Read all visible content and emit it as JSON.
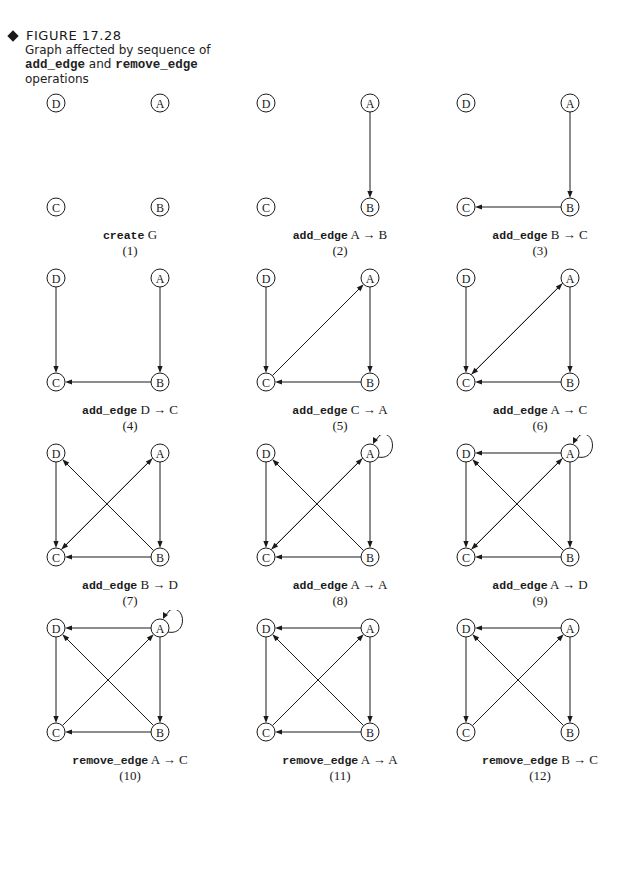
{
  "figure": {
    "number": "FIGURE 17.28",
    "caption_prefix": "Graph affected by sequence of",
    "caption_code_1": "add_edge",
    "caption_and": "and",
    "caption_code_2": "remove_edge",
    "caption_suffix": "operations"
  },
  "nodes": [
    "A",
    "B",
    "C",
    "D"
  ],
  "arrow": "→",
  "panels": [
    {
      "op": "create",
      "args": "G",
      "num": "(1)",
      "edges": [],
      "self_loop_A": false
    },
    {
      "op": "add_edge",
      "args": "A → B",
      "num": "(2)",
      "edges": [
        [
          "A",
          "B"
        ]
      ],
      "self_loop_A": false
    },
    {
      "op": "add_edge",
      "args": "B → C",
      "num": "(3)",
      "edges": [
        [
          "A",
          "B"
        ],
        [
          "B",
          "C"
        ]
      ],
      "self_loop_A": false
    },
    {
      "op": "add_edge",
      "args": "D → C",
      "num": "(4)",
      "edges": [
        [
          "A",
          "B"
        ],
        [
          "B",
          "C"
        ],
        [
          "D",
          "C"
        ]
      ],
      "self_loop_A": false
    },
    {
      "op": "add_edge",
      "args": "C → A",
      "num": "(5)",
      "edges": [
        [
          "A",
          "B"
        ],
        [
          "B",
          "C"
        ],
        [
          "D",
          "C"
        ],
        [
          "C",
          "A"
        ]
      ],
      "self_loop_A": false
    },
    {
      "op": "add_edge",
      "args": "A → C",
      "num": "(6)",
      "edges": [
        [
          "A",
          "B"
        ],
        [
          "B",
          "C"
        ],
        [
          "D",
          "C"
        ],
        [
          "C",
          "A"
        ],
        [
          "A",
          "C"
        ]
      ],
      "self_loop_A": false
    },
    {
      "op": "add_edge",
      "args": "B → D",
      "num": "(7)",
      "edges": [
        [
          "A",
          "B"
        ],
        [
          "B",
          "C"
        ],
        [
          "D",
          "C"
        ],
        [
          "C",
          "A"
        ],
        [
          "A",
          "C"
        ],
        [
          "B",
          "D"
        ]
      ],
      "self_loop_A": false
    },
    {
      "op": "add_edge",
      "args": "A → A",
      "num": "(8)",
      "edges": [
        [
          "A",
          "B"
        ],
        [
          "B",
          "C"
        ],
        [
          "D",
          "C"
        ],
        [
          "C",
          "A"
        ],
        [
          "A",
          "C"
        ],
        [
          "B",
          "D"
        ]
      ],
      "self_loop_A": true
    },
    {
      "op": "add_edge",
      "args": "A → D",
      "num": "(9)",
      "edges": [
        [
          "A",
          "B"
        ],
        [
          "B",
          "C"
        ],
        [
          "D",
          "C"
        ],
        [
          "C",
          "A"
        ],
        [
          "A",
          "C"
        ],
        [
          "B",
          "D"
        ],
        [
          "A",
          "D"
        ]
      ],
      "self_loop_A": true
    },
    {
      "op": "remove_edge",
      "args": "A → C",
      "num": "(10)",
      "edges": [
        [
          "A",
          "B"
        ],
        [
          "B",
          "C"
        ],
        [
          "D",
          "C"
        ],
        [
          "C",
          "A"
        ],
        [
          "B",
          "D"
        ],
        [
          "A",
          "D"
        ]
      ],
      "self_loop_A": true
    },
    {
      "op": "remove_edge",
      "args": "A → A",
      "num": "(11)",
      "edges": [
        [
          "A",
          "B"
        ],
        [
          "B",
          "C"
        ],
        [
          "D",
          "C"
        ],
        [
          "C",
          "A"
        ],
        [
          "B",
          "D"
        ],
        [
          "A",
          "D"
        ]
      ],
      "self_loop_A": false
    },
    {
      "op": "remove_edge",
      "args": "B → C",
      "num": "(12)",
      "edges": [
        [
          "A",
          "B"
        ],
        [
          "D",
          "C"
        ],
        [
          "C",
          "A"
        ],
        [
          "B",
          "D"
        ],
        [
          "A",
          "D"
        ]
      ],
      "self_loop_A": false
    }
  ],
  "colors": {
    "ink": "#1a1a1a",
    "background": "#ffffff"
  }
}
